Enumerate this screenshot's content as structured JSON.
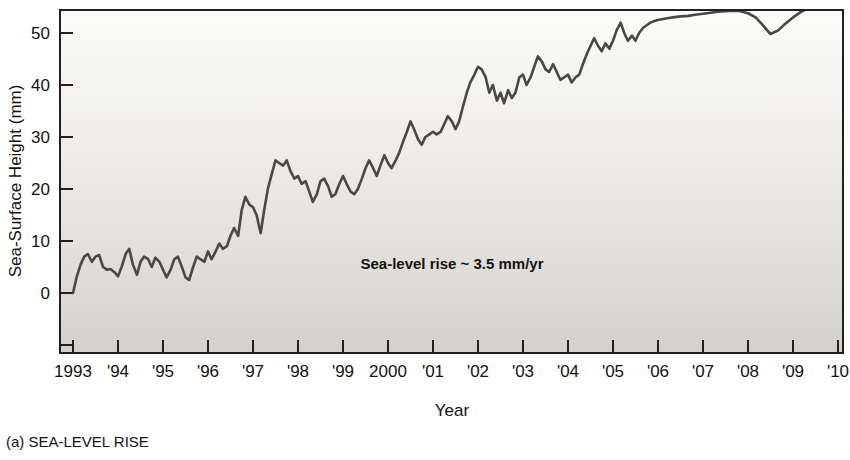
{
  "caption": {
    "label": "(a) SEA-LEVEL RISE"
  },
  "annotation": {
    "text": "Sea-level rise ~ 3.5 mm/yr"
  },
  "chart_data": {
    "type": "line",
    "title": "",
    "xlabel": "Year",
    "ylabel": "Sea-Surface Height (mm)",
    "xlim": [
      1993,
      2010
    ],
    "ylim": [
      -13,
      59
    ],
    "grid": false,
    "legend": null,
    "x_tick_labels": [
      "1993",
      "'94",
      "'95",
      "'96",
      "'97",
      "'98",
      "'99",
      "2000",
      "'01",
      "'02",
      "'03",
      "'04",
      "'05",
      "'06",
      "'07",
      "'08",
      "'09",
      "'10"
    ],
    "x_ticks": [
      1993,
      1994,
      1995,
      1996,
      1997,
      1998,
      1999,
      2000,
      2001,
      2002,
      2003,
      2004,
      2005,
      2006,
      2007,
      2008,
      2009,
      2010
    ],
    "y_tick_labels": [
      "0",
      "10",
      "20",
      "30",
      "40",
      "50"
    ],
    "y_ticks": [
      0,
      10,
      20,
      30,
      40,
      50
    ],
    "y_minor_ticks": [
      -10
    ],
    "series": [
      {
        "name": "Sea-surface height",
        "units": "mm",
        "x": [
          1993.0,
          1993.08,
          1993.17,
          1993.25,
          1993.33,
          1993.42,
          1993.5,
          1993.58,
          1993.67,
          1993.75,
          1993.83,
          1993.92,
          1994.0,
          1994.08,
          1994.17,
          1994.25,
          1994.33,
          1994.42,
          1994.5,
          1994.58,
          1994.67,
          1994.75,
          1994.83,
          1994.92,
          1995.0,
          1995.08,
          1995.17,
          1995.25,
          1995.33,
          1995.42,
          1995.5,
          1995.58,
          1995.67,
          1995.75,
          1995.83,
          1995.92,
          1996.0,
          1996.08,
          1996.17,
          1996.25,
          1996.33,
          1996.42,
          1996.5,
          1996.58,
          1996.67,
          1996.75,
          1996.83,
          1996.92,
          1997.0,
          1997.08,
          1997.17,
          1997.25,
          1997.33,
          1997.42,
          1997.5,
          1997.58,
          1997.67,
          1997.75,
          1997.83,
          1997.92,
          1998.0,
          1998.08,
          1998.17,
          1998.25,
          1998.33,
          1998.42,
          1998.5,
          1998.58,
          1998.67,
          1998.75,
          1998.83,
          1998.92,
          1999.0,
          1999.08,
          1999.17,
          1999.25,
          1999.33,
          1999.42,
          1999.5,
          1999.58,
          1999.67,
          1999.75,
          1999.83,
          1999.92,
          2000.0,
          2000.08,
          2000.17,
          2000.25,
          2000.33,
          2000.42,
          2000.5,
          2000.58,
          2000.67,
          2000.75,
          2000.83,
          2000.92,
          2001.0,
          2001.08,
          2001.17,
          2001.25,
          2001.33,
          2001.42,
          2001.5,
          2001.58,
          2001.67,
          2001.75,
          2001.83,
          2001.92,
          2002.0,
          2002.08,
          2002.17,
          2002.25,
          2002.33,
          2002.42,
          2002.5,
          2002.58,
          2002.67,
          2002.75,
          2002.83,
          2002.92,
          2003.0,
          2003.08,
          2003.17,
          2003.25,
          2003.33,
          2003.42,
          2003.5,
          2003.58,
          2003.67,
          2003.75,
          2003.83,
          2003.92,
          2004.0,
          2004.08,
          2004.17,
          2004.25,
          2004.33,
          2004.42,
          2004.5,
          2004.58,
          2004.67,
          2004.75,
          2004.83,
          2004.92,
          2005.0,
          2005.08,
          2005.17,
          2005.25,
          2005.33,
          2005.42,
          2005.5,
          2005.58,
          2005.67,
          2005.75,
          2005.83,
          2005.92,
          2006.0,
          2006.17,
          2006.33,
          2006.5,
          2006.67,
          2006.83,
          2007.0,
          2007.17,
          2007.33,
          2007.5,
          2007.67,
          2007.83,
          2008.0,
          2008.17,
          2008.33,
          2008.5,
          2008.67,
          2008.83,
          2009.0,
          2009.17,
          2009.33,
          2009.5,
          2009.67,
          2009.83,
          2010.0
        ],
        "y": [
          0.0,
          3.0,
          5.5,
          7.0,
          7.5,
          6.0,
          7.0,
          7.3,
          5.0,
          4.5,
          4.6,
          4.0,
          3.2,
          5.0,
          7.5,
          8.5,
          5.5,
          3.5,
          6.0,
          7.0,
          6.5,
          5.0,
          6.8,
          6.0,
          4.5,
          3.0,
          4.5,
          6.5,
          7.0,
          5.0,
          3.0,
          2.5,
          5.0,
          7.0,
          6.5,
          6.0,
          8.0,
          6.5,
          8.0,
          9.5,
          8.5,
          9.0,
          11.0,
          12.5,
          11.0,
          16.0,
          18.5,
          17.0,
          16.5,
          15.0,
          11.5,
          16.0,
          20.0,
          23.0,
          25.5,
          25.0,
          24.5,
          25.5,
          23.5,
          22.0,
          22.5,
          21.0,
          21.5,
          19.5,
          17.5,
          19.0,
          21.5,
          22.0,
          20.5,
          18.5,
          19.0,
          21.0,
          22.5,
          21.0,
          19.5,
          19.0,
          20.0,
          22.0,
          24.0,
          25.5,
          24.0,
          22.5,
          24.5,
          26.5,
          25.0,
          24.0,
          25.5,
          27.0,
          29.0,
          31.0,
          33.0,
          31.5,
          29.5,
          28.5,
          30.0,
          30.5,
          31.0,
          30.5,
          31.0,
          32.5,
          34.0,
          33.0,
          31.5,
          33.0,
          36.0,
          38.5,
          40.5,
          42.0,
          43.5,
          43.0,
          41.5,
          38.5,
          40.0,
          37.0,
          38.5,
          36.5,
          39.0,
          37.5,
          38.5,
          41.5,
          42.0,
          40.0,
          41.5,
          43.5,
          45.5,
          44.5,
          43.0,
          42.5,
          44.0,
          42.5,
          41.0,
          41.5,
          42.0,
          40.5,
          41.5,
          42.0,
          44.0,
          46.0,
          47.5,
          49.0,
          47.5,
          46.5,
          48.0,
          47.0,
          48.5,
          50.5,
          52.0,
          50.0,
          48.5,
          49.5,
          48.5,
          50.0,
          51.0,
          51.5,
          52.0,
          52.3,
          52.5,
          52.8,
          53.0,
          53.2,
          53.3,
          53.5,
          53.7,
          53.9,
          54.1,
          54.2,
          54.3,
          54.2,
          53.8,
          53.0,
          51.5,
          49.8,
          50.5,
          51.8,
          53.0,
          54.0,
          54.8,
          55.4,
          56.0,
          56.5,
          57.2
        ]
      }
    ]
  }
}
